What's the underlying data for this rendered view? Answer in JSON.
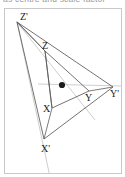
{
  "caption": {
    "text": "as centre and scale factor"
  },
  "figure": {
    "background": "#ffffff",
    "frame_color": "#c9c9c9",
    "center_point": {
      "name": "centre-of-enlargement",
      "x": 62,
      "y": 85,
      "radius": 3.1,
      "color": "#1a1a1a"
    },
    "line_colors": {
      "triangle_stroke": "#5a5a5a",
      "ray_stroke": "#b8b8b8"
    },
    "image_triangle": {
      "name": "triangle-XYZ",
      "stroke": "#5a5a5a",
      "stroke_width": 0.85,
      "vertices": [
        {
          "label": "X",
          "x": 52,
          "y": 108,
          "label_x": 43,
          "label_y": 112
        },
        {
          "label": "Y",
          "x": 89,
          "y": 91,
          "label_x": 85,
          "label_y": 101
        },
        {
          "label": "Z",
          "x": 45,
          "y": 51,
          "label_x": 42,
          "label_y": 49
        }
      ]
    },
    "object_triangle": {
      "name": "triangle-X-prime-Y-prime-Z-prime",
      "stroke": "#5a5a5a",
      "stroke_width": 0.85,
      "vertices": [
        {
          "label": "X'",
          "x": 44,
          "y": 139,
          "label_x": 43,
          "label_y": 152
        },
        {
          "label": "Y'",
          "x": 113,
          "y": 87,
          "label_x": 112,
          "label_y": 97
        },
        {
          "label": "Z'",
          "x": 17,
          "y": 22,
          "label_x": 20,
          "label_y": 20
        }
      ]
    },
    "rays": [
      {
        "name": "ray-through-X",
        "x1": 17,
        "y1": 22,
        "x2": 50,
        "y2": 177
      },
      {
        "name": "ray-through-Y",
        "x1": 38,
        "y1": 84,
        "x2": 122,
        "y2": 86
      },
      {
        "name": "ray-through-Z",
        "x1": 16,
        "y1": 21,
        "x2": 95,
        "y2": 120
      }
    ],
    "labels": [
      "X",
      "Y",
      "Z",
      "X'",
      "Y'",
      "Z'"
    ]
  }
}
